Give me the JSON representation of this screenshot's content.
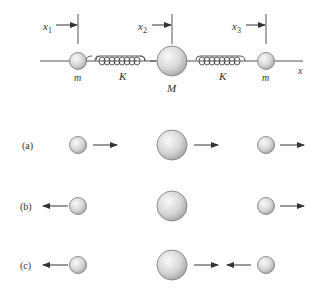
{
  "diagram": {
    "top": {
      "axis_label": "x",
      "position_labels": [
        {
          "main": "x",
          "sub": "1"
        },
        {
          "main": "x",
          "sub": "2"
        },
        {
          "main": "x",
          "sub": "3"
        }
      ],
      "mass_labels": [
        "m",
        "M",
        "m"
      ],
      "spring_labels": [
        "K",
        "K"
      ]
    },
    "modes": [
      {
        "label": "(a)",
        "arrows": [
          "right",
          "right",
          "right"
        ]
      },
      {
        "label": "(b)",
        "arrows": [
          "left",
          "none",
          "right"
        ]
      },
      {
        "label": "(c)",
        "arrows": [
          "left",
          "right",
          "left"
        ]
      }
    ],
    "colors": {
      "line": "#444444",
      "ball_light": "#f4f4f4",
      "ball_dark": "#a8a8a8",
      "text": "#333333"
    }
  }
}
